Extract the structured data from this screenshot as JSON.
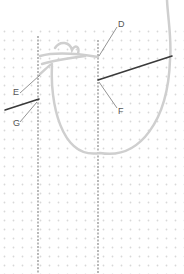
{
  "diagram": {
    "type": "embroidery-stitch-illustration",
    "labels": [
      {
        "id": "D",
        "text": "D",
        "x": 118,
        "y": 18
      },
      {
        "id": "E",
        "text": "E",
        "x": 13,
        "y": 88
      },
      {
        "id": "F",
        "text": "F",
        "x": 118,
        "y": 107
      },
      {
        "id": "G",
        "text": "G",
        "x": 13,
        "y": 119
      }
    ],
    "colors": {
      "background": "#ffffff",
      "grid_dot": "#d8d8d8",
      "stitch_line": "#8a8a8a",
      "thread": "#c9c9c9",
      "needle": "#3a3a3a",
      "leader": "#666666"
    }
  }
}
